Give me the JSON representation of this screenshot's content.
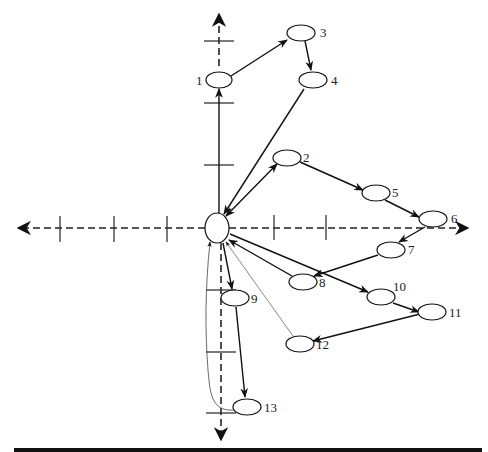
{
  "diagram": {
    "type": "directed-graph-on-axes",
    "center_node": {
      "id": "0",
      "label": "",
      "cx": 217,
      "cy": 228,
      "rx": 12,
      "ry": 15
    },
    "nodes": [
      {
        "id": "1",
        "label": "1",
        "cx": 219,
        "cy": 80,
        "label_side": "left"
      },
      {
        "id": "2",
        "label": "2",
        "cx": 287,
        "cy": 158,
        "label_side": "right"
      },
      {
        "id": "3",
        "label": "3",
        "cx": 301,
        "cy": 33,
        "label_side": "right"
      },
      {
        "id": "4",
        "label": "4",
        "cx": 313,
        "cy": 80,
        "label_side": "right"
      },
      {
        "id": "5",
        "label": "5",
        "cx": 376,
        "cy": 193,
        "label_side": "right"
      },
      {
        "id": "6",
        "label": "6",
        "cx": 433,
        "cy": 219,
        "label_side": "right"
      },
      {
        "id": "7",
        "label": "7",
        "cx": 391,
        "cy": 250,
        "label_side": "right"
      },
      {
        "id": "8",
        "label": "8",
        "cx": 303,
        "cy": 282,
        "label_side": "right"
      },
      {
        "id": "9",
        "label": "9",
        "cx": 235,
        "cy": 298,
        "label_side": "right"
      },
      {
        "id": "10",
        "label": "10",
        "cx": 381,
        "cy": 297,
        "label_side": "right-top"
      },
      {
        "id": "11",
        "label": "11",
        "cx": 432,
        "cy": 312,
        "label_side": "right"
      },
      {
        "id": "12",
        "label": "12",
        "cx": 300,
        "cy": 344,
        "label_side": "right"
      },
      {
        "id": "13",
        "label": "13",
        "cx": 247,
        "cy": 407,
        "label_side": "right"
      }
    ],
    "edges": [
      {
        "from": "0",
        "to": "1",
        "style": "solid"
      },
      {
        "from": "1",
        "to": "3",
        "style": "solid"
      },
      {
        "from": "3",
        "to": "4",
        "style": "solid"
      },
      {
        "from": "4",
        "to": "0",
        "style": "solid"
      },
      {
        "from": "0",
        "to": "2",
        "style": "solid-bidirectional"
      },
      {
        "from": "2",
        "to": "5",
        "style": "solid"
      },
      {
        "from": "5",
        "to": "6",
        "style": "solid"
      },
      {
        "from": "6",
        "to": "7",
        "style": "solid"
      },
      {
        "from": "7",
        "to": "8",
        "style": "solid"
      },
      {
        "from": "8",
        "to": "0",
        "style": "solid"
      },
      {
        "from": "0",
        "to": "10",
        "style": "solid"
      },
      {
        "from": "10",
        "to": "11",
        "style": "solid"
      },
      {
        "from": "11",
        "to": "12",
        "style": "solid"
      },
      {
        "from": "12",
        "to": "0",
        "style": "thin"
      },
      {
        "from": "0",
        "to": "9",
        "style": "solid"
      },
      {
        "from": "9",
        "to": "13",
        "style": "solid"
      },
      {
        "from": "13",
        "to": "0",
        "style": "thin-curved"
      }
    ],
    "axes": {
      "style": "dashed-with-arrowheads",
      "origin": [
        217,
        228
      ],
      "horizontal_ticks_x": [
        62,
        115,
        168,
        274,
        327
      ],
      "vertical_ticks_y": [
        41,
        103,
        165,
        290,
        352,
        413
      ]
    }
  }
}
